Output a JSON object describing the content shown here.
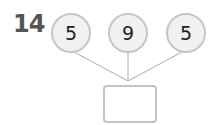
{
  "problem": {
    "number": "14",
    "numbers": [
      "5",
      "9",
      "5"
    ],
    "answer": ""
  },
  "colors": {
    "circle_border": "#c6c6c6",
    "circle_fill": "#f1f1f1",
    "line": "#aaaaaa",
    "number_text": "#555555"
  }
}
